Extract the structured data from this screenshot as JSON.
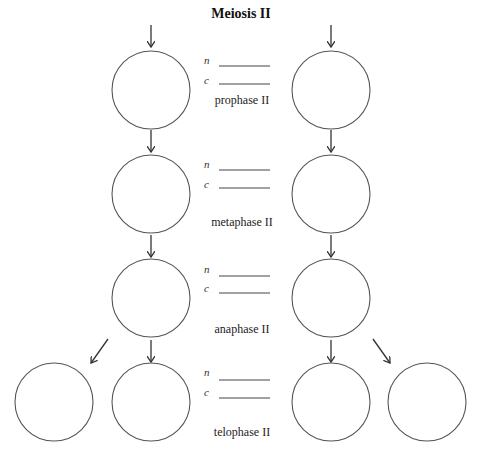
{
  "title": "Meiosis II",
  "labels": {
    "n": "n",
    "c": "c"
  },
  "stages": [
    {
      "id": "prophase",
      "label": "prophase II",
      "n_value": "",
      "c_value": ""
    },
    {
      "id": "metaphase",
      "label": "metaphase II",
      "n_value": "",
      "c_value": ""
    },
    {
      "id": "anaphase",
      "label": "anaphase II",
      "n_value": "",
      "c_value": ""
    },
    {
      "id": "telophase",
      "label": "telophase II",
      "n_value": "",
      "c_value": ""
    }
  ],
  "colors": {
    "stroke": "#555555",
    "text": "#222222",
    "background": "#ffffff"
  }
}
